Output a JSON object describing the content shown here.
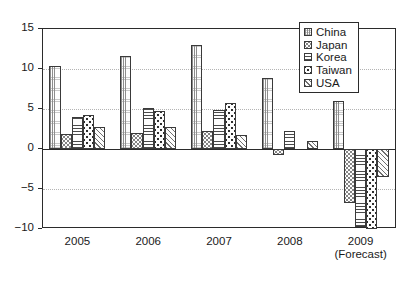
{
  "chart_data": {
    "type": "bar",
    "title": "",
    "subtitle": "",
    "xlabel": "",
    "ylabel": "",
    "categories": [
      "2005",
      "2006",
      "2007",
      "2008",
      "2009"
    ],
    "category_sublabels": [
      "",
      "",
      "",
      "",
      "(Forecast)"
    ],
    "series": [
      {
        "name": "China",
        "values": [
          10.4,
          11.6,
          13.0,
          8.9,
          6.0
        ]
      },
      {
        "name": "Japan",
        "values": [
          1.9,
          2.0,
          2.3,
          -0.7,
          -6.8
        ]
      },
      {
        "name": "Korea",
        "values": [
          4.0,
          5.1,
          4.9,
          2.3,
          -9.8
        ]
      },
      {
        "name": "Taiwan",
        "values": [
          4.2,
          4.8,
          5.7,
          0.0,
          -10.0
        ]
      },
      {
        "name": "USA",
        "values": [
          2.8,
          2.7,
          1.8,
          1.0,
          -3.5
        ]
      }
    ],
    "ylim": [
      -10,
      15
    ],
    "yticks": [
      15,
      10,
      5,
      0,
      -5,
      -10
    ],
    "ytick_labels": [
      "15",
      "10",
      "5",
      "0",
      "−5",
      "−10"
    ],
    "gridlines": [
      10,
      5,
      -5
    ],
    "grid": true,
    "legend_position": "top-right",
    "legend_entries": [
      {
        "label": "China",
        "pattern": "vertical-dotted-lines"
      },
      {
        "label": "Japan",
        "pattern": "fine-stipple-dots"
      },
      {
        "label": "Korea",
        "pattern": "horizontal-lines"
      },
      {
        "label": "Taiwan",
        "pattern": "coarse-dots"
      },
      {
        "label": "USA",
        "pattern": "diagonal-lines"
      }
    ]
  }
}
